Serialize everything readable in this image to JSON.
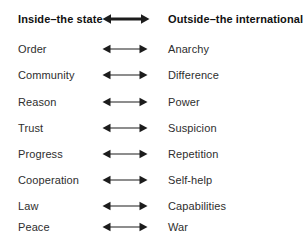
{
  "diagram": {
    "title_left": "Inside–the state",
    "title_right": "Outside–the international",
    "header_arrow_icon": "double-headed-arrow-bold-icon",
    "row_arrow_icon": "double-headed-arrow-icon",
    "colors": {
      "background": "#ffffff",
      "header_text": "#111111",
      "body_text": "#2e2e2e",
      "arrow": "#1c1c1c"
    },
    "rows": [
      {
        "left": "Order",
        "right": "Anarchy"
      },
      {
        "left": "Community",
        "right": "Difference"
      },
      {
        "left": "Reason",
        "right": "Power"
      },
      {
        "left": "Trust",
        "right": "Suspicion"
      },
      {
        "left": "Progress",
        "right": "Repetition"
      },
      {
        "left": "Cooperation",
        "right": "Self-help"
      },
      {
        "left": "Law",
        "right": "Capabilities"
      },
      {
        "left": "Peace",
        "right": "War"
      }
    ]
  }
}
